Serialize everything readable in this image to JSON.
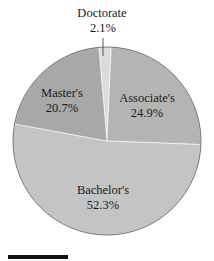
{
  "chart_data": {
    "type": "pie",
    "title": "",
    "start_angle_deg": -5,
    "direction": "clockwise",
    "slices": [
      {
        "label": "Doctorate",
        "value": 2.1,
        "value_label": "2.1%",
        "color": "#dcdcdc"
      },
      {
        "label": "Associate's",
        "value": 24.9,
        "value_label": "24.9%",
        "color": "#b4b4b4"
      },
      {
        "label": "Bachelor's",
        "value": 52.3,
        "value_label": "52.3%",
        "color": "#c4c4c4"
      },
      {
        "label": "Master's",
        "value": 20.7,
        "value_label": "20.7%",
        "color": "#a8a8a8"
      }
    ],
    "legend": "none",
    "labels_position": "inside (Doctorate outside above with leader line)"
  },
  "labels": {
    "doctorate_name": "Doctorate",
    "doctorate_pct": "2.1%",
    "associate_name": "Associate's",
    "associate_pct": "24.9%",
    "bachelor_name": "Bachelor's",
    "bachelor_pct": "52.3%",
    "master_name": "Master's",
    "master_pct": "20.7%"
  }
}
